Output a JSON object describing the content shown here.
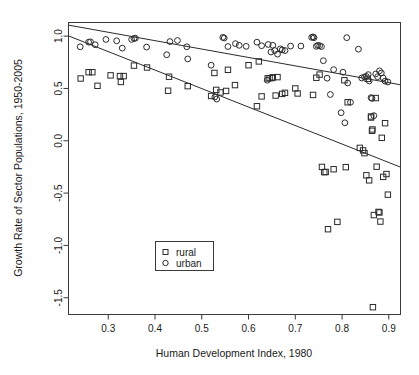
{
  "chart_data": {
    "type": "scatter",
    "title": "",
    "xlabel": "Human Development Index, 1980",
    "ylabel": "Growth Rate of Sector Populations, 1950-2005",
    "xlim": [
      0.215,
      0.925
    ],
    "ylim": [
      -1.66,
      1.13
    ],
    "xticks": [
      0.3,
      0.4,
      0.5,
      0.6,
      0.7,
      0.8,
      0.9
    ],
    "xticklabels": [
      "0.3",
      "0.4",
      "0.5",
      "0.6",
      "0.7",
      "0.8",
      "0.9"
    ],
    "yticks": [
      1.0,
      0.5,
      0.0,
      -0.5,
      -1.0,
      -1.5
    ],
    "yticklabels": [
      "1.0",
      "0.5",
      "0.0",
      "-0.5",
      "-1.0",
      "-1.5"
    ],
    "grid": false,
    "legend_position": "bottom-left",
    "frame": true,
    "series": [
      {
        "name": "rural",
        "marker": "square",
        "color": "#2b2b2b",
        "points": [
          [
            0.241,
            0.595
          ],
          [
            0.258,
            0.655
          ],
          [
            0.266,
            0.655
          ],
          [
            0.277,
            0.525
          ],
          [
            0.305,
            0.625
          ],
          [
            0.325,
            0.618
          ],
          [
            0.327,
            0.562
          ],
          [
            0.333,
            0.618
          ],
          [
            0.355,
            0.718
          ],
          [
            0.383,
            0.7
          ],
          [
            0.428,
            0.478
          ],
          [
            0.43,
            0.612
          ],
          [
            0.47,
            0.522
          ],
          [
            0.52,
            0.428
          ],
          [
            0.527,
            0.648
          ],
          [
            0.531,
            0.486
          ],
          [
            0.54,
            0.462
          ],
          [
            0.552,
            0.476
          ],
          [
            0.556,
            0.678
          ],
          [
            0.571,
            0.532
          ],
          [
            0.6,
            0.722
          ],
          [
            0.618,
            0.33
          ],
          [
            0.622,
            0.758
          ],
          [
            0.628,
            0.424
          ],
          [
            0.641,
            0.596
          ],
          [
            0.645,
            0.598
          ],
          [
            0.65,
            0.6
          ],
          [
            0.652,
            0.606
          ],
          [
            0.658,
            0.432
          ],
          [
            0.662,
            0.608
          ],
          [
            0.672,
            0.448
          ],
          [
            0.678,
            0.458
          ],
          [
            0.7,
            0.5
          ],
          [
            0.705,
            0.452
          ],
          [
            0.738,
            0.438
          ],
          [
            0.745,
            0.602
          ],
          [
            0.752,
            0.632
          ],
          [
            0.757,
            -0.25
          ],
          [
            0.762,
            -0.3
          ],
          [
            0.765,
            -0.298
          ],
          [
            0.77,
            -0.845
          ],
          [
            0.782,
            -0.272
          ],
          [
            0.79,
            -0.775
          ],
          [
            0.805,
            0.578
          ],
          [
            0.808,
            -0.252
          ],
          [
            0.812,
            0.368
          ],
          [
            0.838,
            -0.068
          ],
          [
            0.845,
            -0.092
          ],
          [
            0.848,
            -0.118
          ],
          [
            0.852,
            -0.33
          ],
          [
            0.855,
            0.592
          ],
          [
            0.858,
            -0.378
          ],
          [
            0.862,
            0.232
          ],
          [
            0.862,
            0.222
          ],
          [
            0.864,
            0.095
          ],
          [
            0.865,
            0.108
          ],
          [
            0.866,
            -1.59
          ],
          [
            0.868,
            -0.71
          ],
          [
            0.872,
            0.408
          ],
          [
            0.874,
            -0.248
          ],
          [
            0.878,
            -0.68
          ],
          [
            0.88,
            -0.685
          ],
          [
            0.882,
            -0.772
          ],
          [
            0.885,
            0.028
          ],
          [
            0.888,
            -0.345
          ],
          [
            0.892,
            0.168
          ],
          [
            0.895,
            -0.318
          ],
          [
            0.898,
            -0.515
          ]
        ]
      },
      {
        "name": "urban",
        "marker": "circle",
        "color": "#2b2b2b",
        "points": [
          [
            0.24,
            0.898
          ],
          [
            0.258,
            0.942
          ],
          [
            0.262,
            0.945
          ],
          [
            0.272,
            0.918
          ],
          [
            0.295,
            0.968
          ],
          [
            0.318,
            0.955
          ],
          [
            0.33,
            0.885
          ],
          [
            0.35,
            0.968
          ],
          [
            0.355,
            0.978
          ],
          [
            0.358,
            0.98
          ],
          [
            0.382,
            0.895
          ],
          [
            0.425,
            0.822
          ],
          [
            0.432,
            0.948
          ],
          [
            0.448,
            0.958
          ],
          [
            0.468,
            0.898
          ],
          [
            0.47,
            0.782
          ],
          [
            0.52,
            0.722
          ],
          [
            0.528,
            0.418
          ],
          [
            0.532,
            0.398
          ],
          [
            0.545,
            0.988
          ],
          [
            0.548,
            0.982
          ],
          [
            0.556,
            0.9
          ],
          [
            0.572,
            0.928
          ],
          [
            0.58,
            0.912
          ],
          [
            0.595,
            0.902
          ],
          [
            0.618,
            0.942
          ],
          [
            0.628,
            0.908
          ],
          [
            0.64,
            0.578
          ],
          [
            0.642,
            0.92
          ],
          [
            0.648,
            0.848
          ],
          [
            0.652,
            0.912
          ],
          [
            0.656,
            0.862
          ],
          [
            0.662,
            0.828
          ],
          [
            0.668,
            0.878
          ],
          [
            0.672,
            0.868
          ],
          [
            0.678,
            0.862
          ],
          [
            0.69,
            0.905
          ],
          [
            0.712,
            0.905
          ],
          [
            0.735,
            0.988
          ],
          [
            0.738,
            0.992
          ],
          [
            0.74,
            0.985
          ],
          [
            0.745,
            0.902
          ],
          [
            0.748,
            0.912
          ],
          [
            0.752,
            0.908
          ],
          [
            0.756,
            0.9
          ],
          [
            0.76,
            0.765
          ],
          [
            0.768,
            0.598
          ],
          [
            0.775,
            0.442
          ],
          [
            0.782,
            0.68
          ],
          [
            0.798,
            0.268
          ],
          [
            0.802,
            0.655
          ],
          [
            0.806,
            0.172
          ],
          [
            0.81,
            0.985
          ],
          [
            0.812,
            0.552
          ],
          [
            0.818,
            0.368
          ],
          [
            0.835,
            0.875
          ],
          [
            0.842,
            0.6
          ],
          [
            0.848,
            0.61
          ],
          [
            0.852,
            0.615
          ],
          [
            0.856,
            0.632
          ],
          [
            0.858,
            0.572
          ],
          [
            0.862,
            0.412
          ],
          [
            0.864,
            0.405
          ],
          [
            0.868,
            0.24
          ],
          [
            0.872,
            0.638
          ],
          [
            0.876,
            0.612
          ],
          [
            0.88,
            0.668
          ],
          [
            0.884,
            0.648
          ],
          [
            0.888,
            0.6
          ],
          [
            0.892,
            0.57
          ],
          [
            0.898,
            0.562
          ]
        ]
      }
    ],
    "fit_lines": [
      {
        "name": "urban-fit",
        "x0": 0.215,
        "y0": 1.105,
        "x1": 0.925,
        "y1": 0.535
      },
      {
        "name": "rural-fit",
        "x0": 0.215,
        "y0": 1.002,
        "x1": 0.925,
        "y1": -0.252
      }
    ],
    "legend": {
      "entries": [
        {
          "label": "rural",
          "marker": "square"
        },
        {
          "label": "urban",
          "marker": "circle"
        }
      ]
    }
  }
}
